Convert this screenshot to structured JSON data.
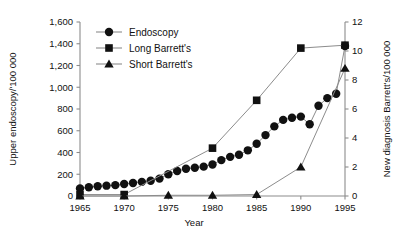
{
  "chart_data": {
    "type": "line",
    "title": "",
    "xlabel": "Year",
    "ylabel": "Upper endoscopy/'100 000",
    "y2label": "New diagnosis Barrett's/100 000",
    "xlim": [
      1965,
      1995
    ],
    "ylim": [
      0,
      1600
    ],
    "y2lim": [
      0,
      12
    ],
    "xticks": [
      1965,
      1970,
      1975,
      1980,
      1985,
      1990,
      1995
    ],
    "xticklabels": [
      "1965",
      "1970",
      "1975",
      "1980",
      "1985",
      "1990",
      "1995"
    ],
    "yticks": [
      0,
      200,
      400,
      600,
      800,
      1000,
      1200,
      1400,
      1600
    ],
    "yticklabels": [
      "0",
      "200",
      "400",
      "600",
      "800",
      "1,000",
      "1,200",
      "1,400",
      "1,600"
    ],
    "y2ticks": [
      0,
      2,
      4,
      6,
      8,
      10,
      12
    ],
    "y2ticklabels": [
      "0",
      "2",
      "4",
      "6",
      "8",
      "10",
      "12"
    ],
    "grid": false,
    "legend_position": "top-left-inside",
    "series": [
      {
        "name": "Endoscopy",
        "marker": "circle",
        "axis": "left",
        "x": [
          1965,
          1966,
          1967,
          1968,
          1969,
          1970,
          1971,
          1972,
          1973,
          1974,
          1975,
          1976,
          1977,
          1978,
          1979,
          1980,
          1981,
          1982,
          1983,
          1984,
          1985,
          1986,
          1987,
          1988,
          1989,
          1990,
          1991,
          1992,
          1993,
          1994,
          1995
        ],
        "values": [
          70,
          80,
          90,
          95,
          100,
          110,
          120,
          130,
          140,
          160,
          200,
          230,
          250,
          260,
          270,
          290,
          330,
          360,
          380,
          420,
          480,
          560,
          640,
          700,
          720,
          730,
          660,
          830,
          900,
          940,
          1380
        ]
      },
      {
        "name": "Long Barrett's",
        "marker": "square",
        "axis": "right",
        "x": [
          1965,
          1970,
          1980,
          1985,
          1990,
          1995
        ],
        "values": [
          0.1,
          0.1,
          3.3,
          6.6,
          10.2,
          10.4
        ]
      },
      {
        "name": "Short Barrett's",
        "marker": "triangle",
        "axis": "right",
        "x": [
          1965,
          1970,
          1975,
          1980,
          1985,
          1990,
          1995
        ],
        "values": [
          0.0,
          0.0,
          0.05,
          0.05,
          0.1,
          2.0,
          8.8
        ]
      }
    ]
  },
  "legend": {
    "items": [
      {
        "label": "Endoscopy",
        "marker": "circle"
      },
      {
        "label": "Long Barrett's",
        "marker": "square"
      },
      {
        "label": "Short Barrett's",
        "marker": "triangle"
      }
    ]
  }
}
